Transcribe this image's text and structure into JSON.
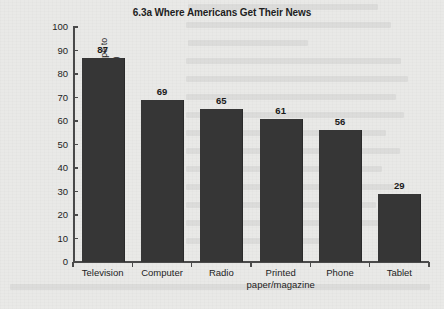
{
  "chart_data": {
    "type": "bar",
    "title": "6.3a Where Americans Get Their News",
    "categories": [
      "Television",
      "Computer",
      "Radio",
      "Printed paper/magazine",
      "Phone",
      "Tablet"
    ],
    "category_lines": [
      [
        "Television"
      ],
      [
        "Computer"
      ],
      [
        "Radio"
      ],
      [
        "Printed",
        "paper/magazine"
      ],
      [
        "Phone"
      ],
      [
        "Tablet"
      ]
    ],
    "values": [
      87,
      69,
      65,
      61,
      56,
      29
    ],
    "value_labels": [
      "87",
      "69",
      "65",
      "61",
      "56",
      "29"
    ],
    "xlabel": "",
    "ylabel": "Percent who consulted each media type to get news in the past week (2014)",
    "ylabel_lines": [
      "Percent who consulted each media type to",
      "get news in the past week (2014)"
    ],
    "ylim": [
      0,
      100
    ],
    "ytick_step": 10,
    "ytick_labels": [
      "100",
      "90",
      "80",
      "70",
      "60",
      "50",
      "40",
      "30",
      "20",
      "10",
      "0"
    ],
    "grid": false,
    "legend": null,
    "bar_color": "#363636",
    "axis_color": "#4a4a4a",
    "text_color": "#1d1d1d",
    "background_color": "#e9e9e7"
  }
}
